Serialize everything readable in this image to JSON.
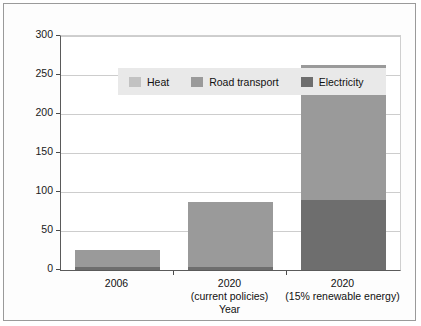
{
  "chart_data": {
    "type": "bar",
    "subtype": "stacked-bar",
    "title": "",
    "xlabel": "Year",
    "ylabel": "Renewable energy (TWh)",
    "ylim": [
      0,
      300
    ],
    "yticks": [
      0,
      50,
      100,
      150,
      200,
      250,
      300
    ],
    "ytick_labels": [
      "0",
      "50",
      "100",
      "150",
      "200",
      "250",
      "300"
    ],
    "grid": "horizontal",
    "legend_position": "inside top-left",
    "categories": [
      "2006",
      "2020",
      "2020"
    ],
    "category_sublabels": [
      "",
      "(current policies)",
      "(15% renewable energy)"
    ],
    "series": [
      {
        "name": "Electricity",
        "color": "#6e6e6e",
        "values": [
          4,
          4,
          90
        ]
      },
      {
        "name": "Road transport",
        "color": "#9a9a9a",
        "values": [
          22,
          83,
          173
        ]
      },
      {
        "name": "Heat",
        "color": "#c2c2c2",
        "values": [
          0,
          0,
          0
        ]
      }
    ],
    "totals": [
      26,
      87,
      263
    ],
    "legend_entries": [
      "Heat",
      "Road transport",
      "Electricity"
    ]
  },
  "axes": {
    "y_label": "Renewable energy (TWh)",
    "x_label": "Year",
    "y_ticks": [
      "300",
      "250",
      "200",
      "150",
      "100",
      "50",
      "0"
    ],
    "x_categories": [
      {
        "line1": "2006",
        "line2": ""
      },
      {
        "line1": "2020",
        "line2": "(current policies)"
      },
      {
        "line1": "2020",
        "line2": "(15% renewable energy)"
      }
    ]
  },
  "legend": {
    "items": [
      {
        "label": "Heat",
        "color": "#c2c2c2"
      },
      {
        "label": "Road transport",
        "color": "#9a9a9a"
      },
      {
        "label": "Electricity",
        "color": "#6e6e6e"
      }
    ]
  }
}
